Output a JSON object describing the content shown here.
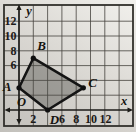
{
  "figure": {
    "grid_color": "#45433e",
    "shape_fill": "#a8a6a1",
    "shape_outline": "#141414"
  },
  "chart_data": {
    "type": "polygon",
    "vertices": [
      {
        "label": "A",
        "x": 0,
        "y": 3
      },
      {
        "label": "B",
        "x": 2,
        "y": 7
      },
      {
        "label": "C",
        "x": 9,
        "y": 3
      },
      {
        "label": "D",
        "x": 4,
        "y": 0
      }
    ],
    "xlabel": "x",
    "ylabel": "y",
    "origin_label": "O",
    "x_tick_labels": [
      "2",
      "6",
      "8",
      "10",
      "12"
    ],
    "x_tick_values": [
      2,
      6,
      8,
      10,
      12
    ],
    "y_tick_labels": [
      "12",
      "10",
      "8",
      "6"
    ],
    "y_tick_values": [
      12,
      10,
      8,
      6
    ],
    "xlim": [
      -2,
      16
    ],
    "ylim": [
      -2,
      14
    ],
    "grid": true,
    "grid_step": 2,
    "legend": false
  }
}
